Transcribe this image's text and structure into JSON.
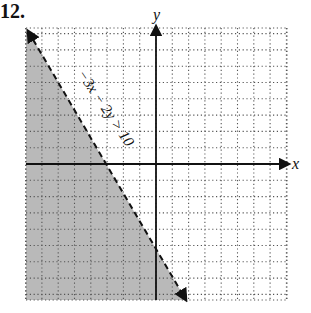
{
  "problem_number": "12.",
  "chart_data": {
    "type": "line",
    "title": "",
    "inequality": "−3x − 2y > 10",
    "boundary_equation": "y = -1.5x - 5",
    "boundary_style": "dashed",
    "shaded_side": "below-left",
    "xlabel": "x",
    "ylabel": "y",
    "xlim": [
      -8,
      8
    ],
    "ylim": [
      -8.3,
      8.3
    ],
    "grid": true,
    "grid_style": "dotted",
    "boundary_points": [
      [
        -8.67,
        8.0
      ],
      [
        -3.33,
        0
      ],
      [
        0,
        -5
      ],
      [
        2.0,
        -8.0
      ]
    ],
    "annotation": {
      "text": "−3x − 2y > 10",
      "rotation_deg": 56
    }
  },
  "colors": {
    "shade": "#b9b9b9",
    "line": "#111111",
    "grid": "#555555",
    "axis": "#111111"
  }
}
